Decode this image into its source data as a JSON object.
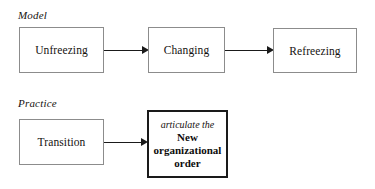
{
  "diagram": {
    "background_color": "#ffffff",
    "rows": [
      {
        "caption": "Model",
        "nodes": [
          {
            "label": "Unfreezing"
          },
          {
            "label": "Changing"
          },
          {
            "label": "Refreezing"
          }
        ]
      },
      {
        "caption": "Practice",
        "nodes": [
          {
            "label": "Transition"
          },
          {
            "lead": "articulate the",
            "line1": "New",
            "line2": "organizational",
            "line3": "order"
          }
        ]
      }
    ],
    "arrows": [
      {
        "name": "unfreezing-to-changing",
        "direction": "right"
      },
      {
        "name": "changing-to-refreezing",
        "direction": "right"
      },
      {
        "name": "transition-to-outcome",
        "direction": "right"
      }
    ],
    "colors": {
      "box_border": "#8c8c8c",
      "emphasis_border": "#1a1a1a",
      "arrow": "#1a1a1a",
      "text": "#15120f"
    }
  }
}
